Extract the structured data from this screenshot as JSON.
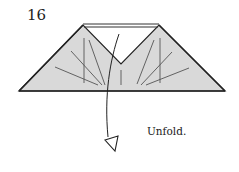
{
  "step": {
    "number": "16"
  },
  "instruction": {
    "text": "Unfold."
  },
  "colors": {
    "paper_fill": "#d9d9d9",
    "outline": "#222222",
    "crease": "#555555",
    "background": "#ffffff"
  },
  "diagram": {
    "shape": "trapezoid-with-v-notch",
    "arrow": "curved-unfold-arrow-hollow-head",
    "crease_lines": 9
  }
}
